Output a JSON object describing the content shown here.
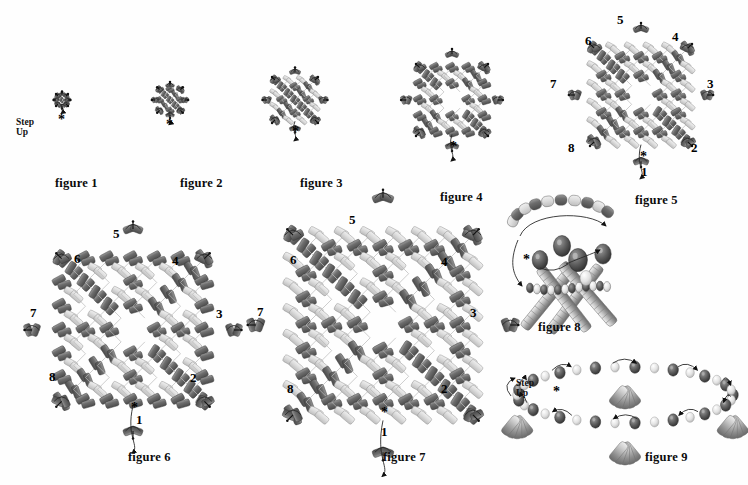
{
  "document": {
    "title": "Beadwork step-by-step diagrams",
    "type": "instructional-diagram-sheet",
    "background_color": "#ffffff",
    "ink_color": "#2b2b2b"
  },
  "legend": {
    "step_up_label": "Step\nUp",
    "star_marker": "*",
    "bead_dark_color": "#6f6f6f",
    "bead_light_color": "#d8d8d8",
    "thread_color": "#9a9a9a",
    "needle_color": "#1a1a1a"
  },
  "figures": [
    {
      "id": "figure-1",
      "caption": "figure 1",
      "caption_x": 55,
      "caption_y": 176,
      "cx": 62,
      "cy": 100,
      "scale": 0.52,
      "style": "flat-cross",
      "rings": 1,
      "has_step_up": true,
      "step_up_x": 16,
      "step_up_y": 118,
      "has_star": true,
      "star_x": 58,
      "star_y": 116,
      "numbers": []
    },
    {
      "id": "figure-2",
      "caption": "figure 2",
      "caption_x": 180,
      "caption_y": 176,
      "cx": 170,
      "cy": 100,
      "scale": 0.66,
      "style": "flat-cross",
      "rings": 2,
      "has_step_up": false,
      "has_star": true,
      "star_x": 166,
      "star_y": 121,
      "numbers": []
    },
    {
      "id": "figure-3",
      "caption": "figure 3",
      "caption_x": 300,
      "caption_y": 176,
      "cx": 295,
      "cy": 100,
      "scale": 0.84,
      "style": "flat-cross",
      "rings": 3,
      "has_step_up": false,
      "has_star": true,
      "star_x": 292,
      "star_y": 128,
      "numbers": []
    },
    {
      "id": "figure-4",
      "caption": "figure 4",
      "caption_x": 440,
      "caption_y": 190,
      "cx": 452,
      "cy": 100,
      "scale": 1.02,
      "style": "flat-cross-open",
      "rings": 4,
      "has_step_up": false,
      "has_star": true,
      "star_x": 450,
      "star_y": 143,
      "numbers": []
    },
    {
      "id": "figure-5",
      "caption": "figure 5",
      "caption_x": 635,
      "caption_y": 193,
      "cx": 641,
      "cy": 95,
      "scale": 1.18,
      "style": "flat-cross-open",
      "rings": 5,
      "has_step_up": false,
      "has_star": true,
      "star_x": 640,
      "star_y": 153,
      "numbers": [
        {
          "text": "5",
          "x": 617,
          "y": 12
        },
        {
          "text": "6",
          "x": 585,
          "y": 33
        },
        {
          "text": "4",
          "x": 672,
          "y": 29
        },
        {
          "text": "7",
          "x": 550,
          "y": 76
        },
        {
          "text": "3",
          "x": 707,
          "y": 76
        },
        {
          "text": "8",
          "x": 568,
          "y": 140
        },
        {
          "text": "2",
          "x": 691,
          "y": 140
        },
        {
          "text": "1",
          "x": 641,
          "y": 164
        }
      ]
    },
    {
      "id": "figure-6",
      "caption": "figure 6",
      "caption_x": 128,
      "caption_y": 450,
      "cx": 133,
      "cy": 330,
      "scale": 1.5,
      "style": "diamond-dense",
      "rings": 6,
      "has_step_up": false,
      "has_star": true,
      "star_x": 131,
      "star_y": 404,
      "numbers": [
        {
          "text": "5",
          "x": 113,
          "y": 226
        },
        {
          "text": "6",
          "x": 74,
          "y": 251
        },
        {
          "text": "4",
          "x": 172,
          "y": 253
        },
        {
          "text": "7",
          "x": 30,
          "y": 305
        },
        {
          "text": "3",
          "x": 216,
          "y": 306
        },
        {
          "text": "8",
          "x": 49,
          "y": 369
        },
        {
          "text": "2",
          "x": 190,
          "y": 370
        },
        {
          "text": "1",
          "x": 136,
          "y": 412
        }
      ]
    },
    {
      "id": "figure-7",
      "caption": "figure 7",
      "caption_x": 383,
      "caption_y": 450,
      "cx": 383,
      "cy": 325,
      "scale": 1.62,
      "style": "diamond-open",
      "rings": 7,
      "has_step_up": false,
      "has_star": true,
      "star_x": 381,
      "star_y": 409,
      "numbers": [
        {
          "text": "5",
          "x": 349,
          "y": 212
        },
        {
          "text": "6",
          "x": 290,
          "y": 252
        },
        {
          "text": "4",
          "x": 441,
          "y": 254
        },
        {
          "text": "7",
          "x": 257,
          "y": 304
        },
        {
          "text": "3",
          "x": 470,
          "y": 305
        },
        {
          "text": "8",
          "x": 287,
          "y": 381
        },
        {
          "text": "2",
          "x": 441,
          "y": 381
        },
        {
          "text": "1",
          "x": 381,
          "y": 424
        }
      ]
    },
    {
      "id": "figure-8",
      "caption": "figure 8",
      "caption_x": 538,
      "caption_y": 320,
      "cx": 570,
      "cy": 270,
      "scale": 1.0,
      "style": "three-d-cluster",
      "has_step_up": false,
      "has_star": true,
      "star_x": 523,
      "star_y": 256,
      "numbers": []
    },
    {
      "id": "figure-9",
      "caption": "figure 9",
      "caption_x": 645,
      "caption_y": 450,
      "cx": 625,
      "cy": 400,
      "scale": 1.0,
      "style": "three-d-band",
      "has_step_up": true,
      "step_up_x": 516,
      "step_up_y": 379,
      "has_star": true,
      "star_x": 553,
      "star_y": 388,
      "numbers": []
    }
  ]
}
